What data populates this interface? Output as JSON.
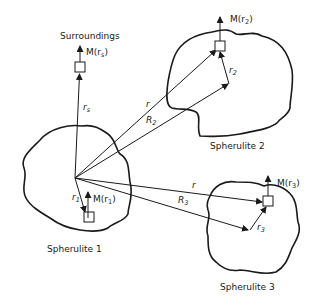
{
  "diagram": {
    "surroundings": {
      "title": "Surroundings",
      "moment": "M(r",
      "moment_sub": "s",
      "moment_close": ")",
      "vector": "r",
      "vector_sub": "s"
    },
    "spherulite1": {
      "title": "Spherulite 1",
      "moment": "M(r",
      "moment_sub": "1",
      "moment_close": ")",
      "vector": "r",
      "vector_sub": "1"
    },
    "spherulite2": {
      "title": "Spherulite 2",
      "moment": "M(r",
      "moment_sub": "2",
      "moment_close": ")",
      "vector": "r",
      "vector_sub": "2",
      "r_label": "r",
      "R_label": "R",
      "R_sub": "2"
    },
    "spherulite3": {
      "title": "Spherulite 3",
      "moment": "M(r",
      "moment_sub": "3",
      "moment_close": ")",
      "vector": "r",
      "vector_sub": "3",
      "r_label": "r",
      "R_label": "R",
      "R_sub": "3"
    }
  }
}
